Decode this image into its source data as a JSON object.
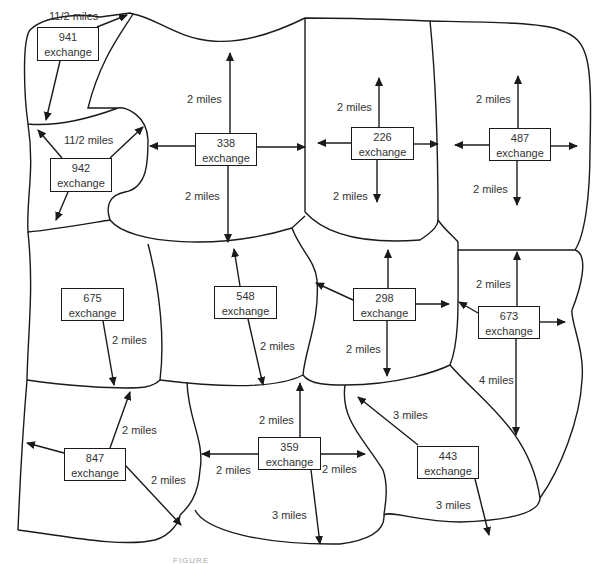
{
  "exchanges": [
    {
      "id": "941",
      "label": "exchange",
      "x": 37,
      "y": 27,
      "w": 62,
      "h": 34
    },
    {
      "id": "942",
      "label": "exchange",
      "x": 50,
      "y": 158,
      "w": 62,
      "h": 34
    },
    {
      "id": "338",
      "label": "exchange",
      "x": 195,
      "y": 133,
      "w": 62,
      "h": 33
    },
    {
      "id": "226",
      "label": "exchange",
      "x": 351,
      "y": 127,
      "w": 63,
      "h": 33
    },
    {
      "id": "487",
      "label": "exchange",
      "x": 489,
      "y": 128,
      "w": 62,
      "h": 33
    },
    {
      "id": "675",
      "label": "exchange",
      "x": 61,
      "y": 288,
      "w": 63,
      "h": 33
    },
    {
      "id": "548",
      "label": "exchange",
      "x": 214,
      "y": 286,
      "w": 63,
      "h": 33
    },
    {
      "id": "298",
      "label": "exchange",
      "x": 353,
      "y": 288,
      "w": 63,
      "h": 33
    },
    {
      "id": "673",
      "label": "exchange",
      "x": 478,
      "y": 306,
      "w": 62,
      "h": 33
    },
    {
      "id": "847",
      "label": "exchange",
      "x": 64,
      "y": 448,
      "w": 62,
      "h": 33
    },
    {
      "id": "359",
      "label": "exchange",
      "x": 258,
      "y": 437,
      "w": 63,
      "h": 33
    },
    {
      "id": "443",
      "label": "exchange",
      "x": 417,
      "y": 446,
      "w": 62,
      "h": 33
    }
  ],
  "distances": [
    {
      "text": "11/2 miles",
      "x": 49,
      "y": 36
    },
    {
      "text": "11/2 miles",
      "x": 64,
      "y": 134
    },
    {
      "text": "2 miles",
      "x": 187,
      "y": 93
    },
    {
      "text": "2 miles",
      "x": 185,
      "y": 190
    },
    {
      "text": "2 miles",
      "x": 337,
      "y": 101
    },
    {
      "text": "2 miles",
      "x": 333,
      "y": 190
    },
    {
      "text": "2 miles",
      "x": 476,
      "y": 93
    },
    {
      "text": "2 miles",
      "x": 473,
      "y": 183
    },
    {
      "text": "2 miles",
      "x": 112,
      "y": 334
    },
    {
      "text": "2 miles",
      "x": 260,
      "y": 340
    },
    {
      "text": "2 miles",
      "x": 346,
      "y": 343
    },
    {
      "text": "2 miles",
      "x": 476,
      "y": 278
    },
    {
      "text": "4 miles",
      "x": 479,
      "y": 374
    },
    {
      "text": "2 miles",
      "x": 122,
      "y": 424
    },
    {
      "text": "2 miles",
      "x": 151,
      "y": 474
    },
    {
      "text": "2 miles",
      "x": 259,
      "y": 414
    },
    {
      "text": "2 miles",
      "x": 216,
      "y": 464
    },
    {
      "text": "2 miles",
      "x": 322,
      "y": 463
    },
    {
      "text": "3 miles",
      "x": 272,
      "y": 509
    },
    {
      "text": "3 miles",
      "x": 393,
      "y": 409
    },
    {
      "text": "3 miles",
      "x": 436,
      "y": 499
    }
  ],
  "caption": "FIGURE"
}
